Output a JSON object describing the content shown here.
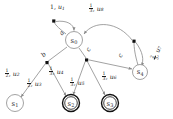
{
  "diagram": {
    "type": "probabilistic-automaton",
    "title": "",
    "states": [
      {
        "id": "s0",
        "label": "s",
        "sub": "0",
        "accepting": false,
        "x": 74,
        "y": 40,
        "r": 8.5
      },
      {
        "id": "s1",
        "label": "s",
        "sub": "1",
        "accepting": false,
        "x": 15,
        "y": 103,
        "r": 8.5
      },
      {
        "id": "s2",
        "label": "s",
        "sub": "2",
        "accepting": true,
        "x": 71,
        "y": 103,
        "r": 8.5
      },
      {
        "id": "s3",
        "label": "s",
        "sub": "3",
        "accepting": true,
        "x": 110,
        "y": 103,
        "r": 8.5
      },
      {
        "id": "s4",
        "label": "s",
        "sub": "4",
        "accepting": false,
        "x": 140,
        "y": 72,
        "r": 7.5
      }
    ],
    "action_labels": [
      {
        "id": "a-from-s0",
        "text": "a",
        "x": 58,
        "y": 31
      },
      {
        "id": "b-from-s0",
        "text": "b",
        "x": 40,
        "y": 52
      },
      {
        "id": "c-from-s0",
        "text": "c",
        "x": 85,
        "y": 48
      },
      {
        "id": "c-from-s4",
        "text": "c",
        "x": 117,
        "y": 53
      }
    ],
    "transition_labels": [
      {
        "id": "u1",
        "prob_num": "1",
        "prob_den": "",
        "prob_text": "1",
        "var": "u",
        "sub": "1",
        "x": 53,
        "y": 6
      },
      {
        "id": "u8",
        "prob_num": "1",
        "prob_den": "3",
        "prob_text": "1/3",
        "var": "u",
        "sub": "8",
        "x": 94,
        "y": 8
      },
      {
        "id": "u7",
        "prob_num": "2",
        "prob_den": "3",
        "prob_text": "2/3",
        "var": "u",
        "sub": "7",
        "x": 152,
        "y": 44
      },
      {
        "id": "u6",
        "prob_num": "1",
        "prob_den": "3",
        "prob_text": "1/3",
        "var": "u",
        "sub": "6",
        "x": 108,
        "y": 76
      },
      {
        "id": "u2",
        "prob_num": "1",
        "prob_den": "2",
        "prob_text": "1/2",
        "var": "u",
        "sub": "2",
        "x": 11,
        "y": 72
      },
      {
        "id": "u3",
        "prob_num": "1",
        "prob_den": "2",
        "prob_text": "1/2",
        "var": "u",
        "sub": "3",
        "x": 33,
        "y": 81
      },
      {
        "id": "u4",
        "prob_num": "1",
        "prob_den": "3",
        "prob_text": "1/3",
        "var": "u",
        "sub": "4",
        "x": 54,
        "y": 70
      },
      {
        "id": "u5",
        "prob_num": "1",
        "prob_den": "3",
        "prob_text": "1/3",
        "var": "u",
        "sub": "5",
        "x": 75,
        "y": 81
      }
    ],
    "colors": {
      "edge": "#8a8a8a",
      "node_stroke": "#8a8a8a",
      "text": "#1a1a1a",
      "state_text": "#333333",
      "accept_stroke": "#111111",
      "dot": "#111111"
    }
  }
}
